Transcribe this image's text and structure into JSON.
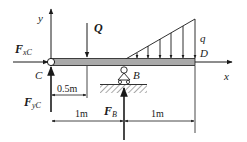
{
  "diagram": {
    "type": "beam free-body diagram",
    "axes": {
      "x_label": "x",
      "y_label": "y"
    },
    "points": {
      "C": "C",
      "B": "B",
      "D": "D"
    },
    "forces": {
      "Q": "Q",
      "q": "q",
      "FxC_main": "F",
      "FxC_sub": "xC",
      "FyC_main": "F",
      "FyC_sub": "yC",
      "FB_main": "F",
      "FB_sub": "B"
    },
    "dimensions": {
      "d_Q": "0.5m",
      "d_CB": "1m",
      "d_BD": "1m"
    },
    "colors": {
      "beam_fill": "#a9a9a9",
      "line": "#1a1a1a",
      "background": "#ffffff"
    }
  }
}
